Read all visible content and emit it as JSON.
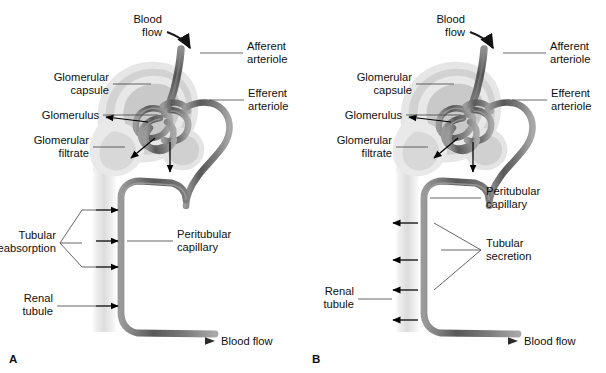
{
  "figure": {
    "background_color": "#ffffff",
    "text_color": "#0f0f0f",
    "leader_color": "#4a4a4a",
    "arrow_color": "#000000",
    "capillary_color": "#6e6e6e",
    "capillary_dark": "#4a4a4a",
    "tubule_color": "#e2e2e2",
    "capsule_color": "#d9d9d9"
  },
  "panels": [
    {
      "id": "A",
      "letter": "A",
      "topic": "tubular-reabsorption",
      "arrow_direction": "right",
      "arrow_meaning": "from renal tubule into peritubular capillary",
      "arrow_count": 4,
      "labels": {
        "blood_flow_top": "Blood\nflow",
        "blood_flow_top_line1": "Blood",
        "blood_flow_top_line2": "flow",
        "afferent_arteriole_line1": "Afferent",
        "afferent_arteriole_line2": "arteriole",
        "efferent_arteriole_line1": "Efferent",
        "efferent_arteriole_line2": "arteriole",
        "glomerular_capsule_line1": "Glomerular",
        "glomerular_capsule_line2": "capsule",
        "glomerulus": "Glomerulus",
        "glomerular_filtrate_line1": "Glomerular",
        "glomerular_filtrate_line2": "filtrate",
        "process_line1": "Tubular",
        "process_line2": "reabsorption",
        "peritubular_capillary_line1": "Peritubular",
        "peritubular_capillary_line2": "capillary",
        "renal_tubule_line1": "Renal",
        "renal_tubule_line2": "tubule",
        "blood_flow_bottom": "Blood flow"
      }
    },
    {
      "id": "B",
      "letter": "B",
      "topic": "tubular-secretion",
      "arrow_direction": "left",
      "arrow_meaning": "from peritubular capillary into renal tubule",
      "arrow_count": 4,
      "labels": {
        "blood_flow_top": "Blood\nflow",
        "blood_flow_top_line1": "Blood",
        "blood_flow_top_line2": "flow",
        "afferent_arteriole_line1": "Afferent",
        "afferent_arteriole_line2": "arteriole",
        "efferent_arteriole_line1": "Efferent",
        "efferent_arteriole_line2": "arteriole",
        "glomerular_capsule_line1": "Glomerular",
        "glomerular_capsule_line2": "capsule",
        "glomerulus": "Glomerulus",
        "glomerular_filtrate_line1": "Glomerular",
        "glomerular_filtrate_line2": "filtrate",
        "process_line1": "Tubular",
        "process_line2": "secretion",
        "peritubular_capillary_line1": "Peritubular",
        "peritubular_capillary_line2": "capillary",
        "renal_tubule_line1": "Renal",
        "renal_tubule_line2": "tubule",
        "blood_flow_bottom": "Blood flow"
      }
    }
  ]
}
